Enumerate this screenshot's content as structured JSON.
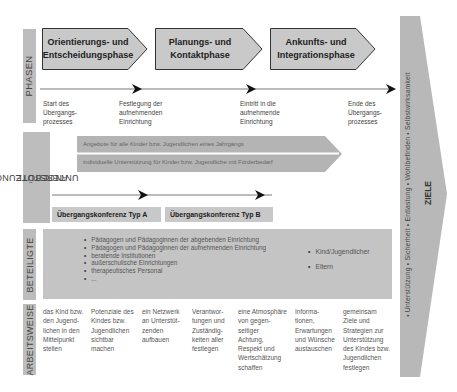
{
  "sections": {
    "phases_label": "PHASEN",
    "support_label_line1": "UNTERSTÜTZUNGS-",
    "support_label_line2": "ANGEBOTE",
    "participants_label": "BETEILIGTE",
    "workmode_label": "ARBEITSWEISE",
    "goals_label": "ZIELE"
  },
  "phases": [
    {
      "line1": "Orientierungs- und",
      "line2": "Entscheidungsphase"
    },
    {
      "line1": "Planungs- und",
      "line2": "Kontaktphase"
    },
    {
      "line1": "Ankunfts- und",
      "line2": "Integrationsphase"
    }
  ],
  "milestones": [
    {
      "line1": "Start des",
      "line2": "Übergangs-",
      "line3": "prozesses"
    },
    {
      "line1": "Festlegung der",
      "line2": "aufnehmenden",
      "line3": "Einrichtung"
    },
    {
      "line1": "Eintritt in die",
      "line2": "aufnehmende",
      "line3": "Einrichtung"
    },
    {
      "line1": "Ende des",
      "line2": "Übergangs-",
      "line3": "prozesses"
    }
  ],
  "support": {
    "bar1": "Angebote für alle Kinder bzw. Jugendlichen eines Jahrgangs",
    "bar2": "individuelle Unterstützung für Kinder bzw. Jugendliche mit Förderbedarf",
    "conference_a": "Übergangskonferenz Typ A",
    "conference_b": "Übergangskonferenz Typ B"
  },
  "participants": {
    "left": [
      "Pädagogen und Pädagoginnen der abgebenden Einrichtung",
      "Pädagogen und Pädagoginnen der aufnehmenden Einrichtung",
      "beratende Institutionen",
      "außerschulische Einrichtungen",
      "therapeutisches Personal",
      "..."
    ],
    "right": [
      "Kind/Jugendlicher",
      "Eltern"
    ]
  },
  "workmode": [
    [
      "das Kind bzw.",
      "den Jugend-",
      "lichen in den",
      "Mittelpunkt",
      "stellen"
    ],
    [
      "Potenziale des",
      "Kindes bzw.",
      "Jugendlichen",
      "sichtbar",
      "machen"
    ],
    [
      "ein Netzwerk",
      "an Unterstüt-",
      "zenden",
      "aufbauen"
    ],
    [
      "Verantwor-",
      "tungen und",
      "Zuständig-",
      "keiten aller",
      "festlegen"
    ],
    [
      "eine Atmosphäre",
      "von gegen-",
      "seitiger",
      "Achtung,",
      "Respekt und",
      "Wertschätzung",
      "schaffen"
    ],
    [
      "Informa-",
      "tionen,",
      "Erwartungen",
      "und Wünsche",
      "austauschen"
    ],
    [
      "gemeinsam",
      "Ziele und",
      "Strategien zur",
      "Unterstützung",
      "des Kindes bzw.",
      "Jugendlichen",
      "festlegen"
    ]
  ],
  "goals": {
    "items_text": "•  Unterstützung  •  Sicherheit  •  Entlastung  •  Wohlbefinden  •  Selbstwirksamkeit"
  },
  "colors": {
    "label_gray": "#bdbdbd",
    "phase_fill": "#c9c9c9",
    "phase_stroke": "#333333",
    "support_bar": "#b4b4b4",
    "conference_fill": "#c8c8c8",
    "participants_fill": "#c4c4c4",
    "goals_fill": "#b8b8b8"
  }
}
